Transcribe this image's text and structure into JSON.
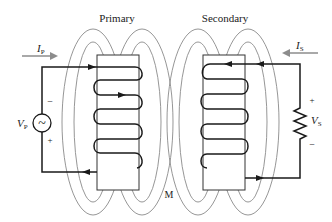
{
  "diagram": {
    "type": "transformer-mutual-inductance",
    "labels": {
      "primary": "Primary",
      "secondary": "Secondary",
      "mutual": "M",
      "primary_current": "I",
      "primary_current_sub": "P",
      "secondary_current": "I",
      "secondary_current_sub": "S",
      "primary_voltage": "V",
      "primary_voltage_sub": "P",
      "secondary_voltage": "V",
      "secondary_voltage_sub": "S",
      "source_symbol": "~",
      "primary_minus": "−",
      "primary_plus": "+",
      "secondary_plus": "+",
      "secondary_minus": "−"
    },
    "components": [
      {
        "name": "ac-voltage-source",
        "side": "primary"
      },
      {
        "name": "primary-coil",
        "turns": 4
      },
      {
        "name": "secondary-coil",
        "turns": 4
      },
      {
        "name": "load-resistor",
        "side": "secondary"
      }
    ],
    "colors": {
      "wire": "#1a1a1a",
      "field_lines": "#8a8a8a",
      "core_outline": "#333333",
      "current_arrow": "#8c8c8c"
    }
  }
}
